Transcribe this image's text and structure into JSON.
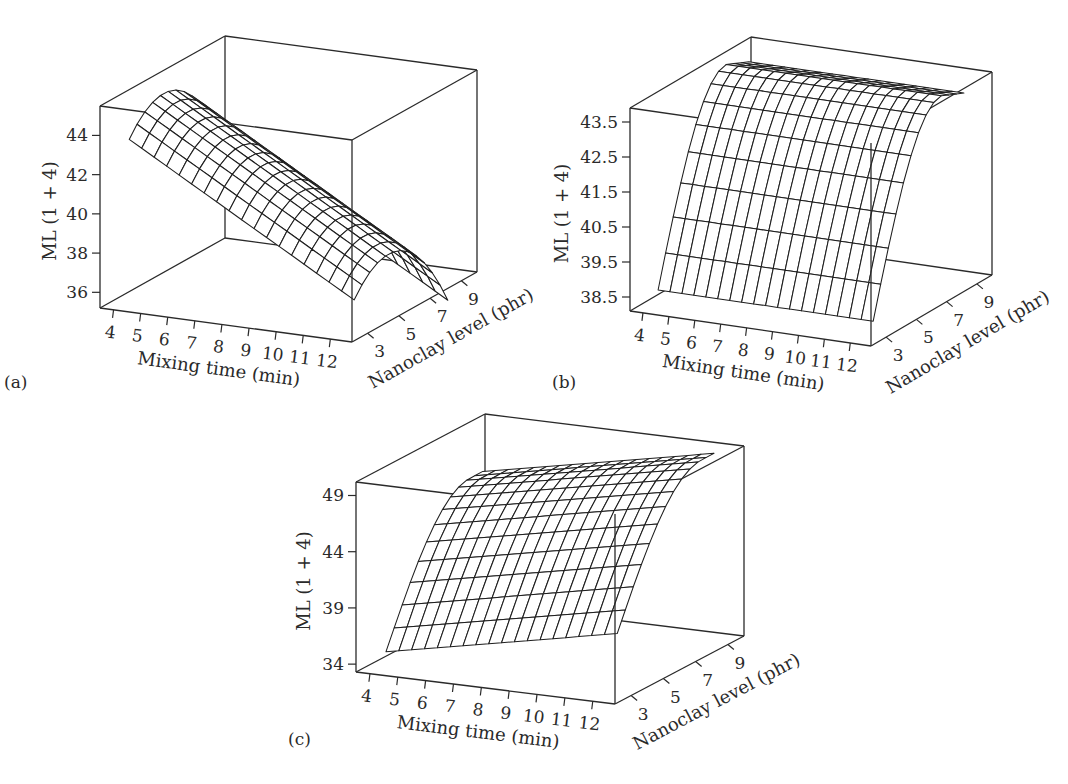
{
  "figure": {
    "panels": [
      {
        "id": "a",
        "label": "(a)"
      },
      {
        "id": "b",
        "label": "(b)"
      },
      {
        "id": "c",
        "label": "(c)"
      }
    ]
  },
  "chart_data": [
    {
      "type": "surface",
      "panel": "(a)",
      "xlabel": "Mixing time (min)",
      "ylabel": "Nanoclay level (phr)",
      "zlabel": "ML (1 + 4)",
      "x_ticks": [
        "4",
        "5",
        "6",
        "7",
        "8",
        "9",
        "10",
        "11",
        "12"
      ],
      "y_ticks": [
        "3",
        "5",
        "7",
        "9"
      ],
      "z_ticks": [
        "36",
        "38",
        "40",
        "42",
        "44"
      ],
      "xlim": [
        3.5,
        12.8
      ],
      "ylim": [
        2,
        10
      ],
      "zlim": [
        35.2,
        45.5
      ],
      "description": "Ridge surface: ML decreases linearly with mixing time; parabolic in nanoclay level with maximum near 5-6 phr",
      "surface_samples": {
        "x": [
          4,
          8,
          12
        ],
        "y": [
          3,
          5.5,
          9
        ],
        "z": [
          [
            43.0,
            44.8,
            41.5
          ],
          [
            39.8,
            41.6,
            38.3
          ],
          [
            36.6,
            38.4,
            35.1
          ]
        ]
      }
    },
    {
      "type": "surface",
      "panel": "(b)",
      "xlabel": "Mixing time (min)",
      "ylabel": "Nanoclay level (phr)",
      "zlabel": "ML (1 + 4)",
      "x_ticks": [
        "4",
        "5",
        "6",
        "7",
        "8",
        "9",
        "10",
        "11",
        "12"
      ],
      "y_ticks": [
        "3",
        "5",
        "7",
        "9"
      ],
      "z_ticks": [
        "38.5",
        "39.5",
        "40.5",
        "41.5",
        "42.5",
        "43.5"
      ],
      "xlim": [
        3.5,
        12.8
      ],
      "ylim": [
        2,
        10
      ],
      "zlim": [
        38.1,
        43.9
      ],
      "description": "Surface nearly constant along mixing time; rises steeply with nanoclay level from ~38.5 at 3 phr, plateauing near 43.8 around 7-8 phr and slightly decreasing at 9 phr",
      "surface_samples": {
        "x": [
          4,
          8,
          12
        ],
        "y": [
          3,
          5,
          7,
          9
        ],
        "z": [
          [
            38.5,
            42.2,
            43.8,
            43.2
          ],
          [
            38.5,
            42.2,
            43.8,
            43.2
          ],
          [
            38.5,
            42.2,
            43.8,
            43.2
          ]
        ]
      }
    },
    {
      "type": "surface",
      "panel": "(c)",
      "xlabel": "Mixing time (min)",
      "ylabel": "Nanoclay level (phr)",
      "zlabel": "ML (1 + 4)",
      "x_ticks": [
        "4",
        "5",
        "6",
        "7",
        "8",
        "9",
        "10",
        "11",
        "12"
      ],
      "y_ticks": [
        "3",
        "5",
        "7",
        "9"
      ],
      "z_ticks": [
        "34",
        "39",
        "44",
        "49"
      ],
      "xlim": [
        3.5,
        12.8
      ],
      "ylim": [
        2,
        10
      ],
      "zlim": [
        33.3,
        50.2
      ],
      "description": "Surface rises with both mixing time and nanoclay level; concave in nanoclay, max ~50 at 12 min and 9 phr, min ~34.5 at 4 min and 3 phr",
      "surface_samples": {
        "x": [
          4,
          8,
          12
        ],
        "y": [
          3,
          6,
          9
        ],
        "z": [
          [
            34.5,
            43.5,
            46.0
          ],
          [
            36.5,
            45.5,
            48.0
          ],
          [
            38.5,
            47.5,
            50.0
          ]
        ]
      }
    }
  ]
}
